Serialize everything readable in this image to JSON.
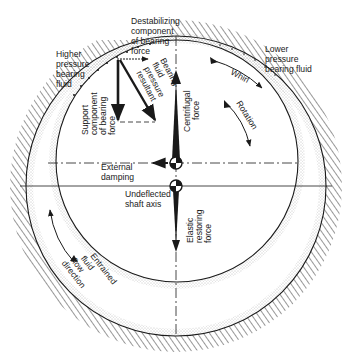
{
  "diagram": {
    "colors": {
      "ink": "#1a1a1a",
      "stipple": "#8a8a8a",
      "background": "#ffffff"
    },
    "labels": {
      "destabilizing": [
        "Destabilizing",
        "component",
        "of bearing",
        "force"
      ],
      "higher_pressure": [
        "Higher",
        "pressure",
        "bearing",
        "fluid"
      ],
      "lower_pressure": [
        "Lower",
        "pressure",
        "bearing fluid"
      ],
      "bearing_resultant": [
        "Bearing",
        "fluid",
        "pressure",
        "resultant"
      ],
      "support_component": [
        "Support",
        "component",
        "of bearing",
        "force"
      ],
      "whirl": "Whirl",
      "rotation": "Rotation",
      "centrifugal": [
        "Centrifugal",
        "force"
      ],
      "external_damping": [
        "External",
        "damping"
      ],
      "undeflected_axis": [
        "Undeflected",
        "shaft axis"
      ],
      "elastic_restoring": [
        "Elastic",
        "restoring",
        "force"
      ],
      "entrained_flow": [
        "Entrained",
        "fluid",
        "flow",
        "direction"
      ]
    },
    "icons": {
      "shaft_center": "shaft-center-symbol",
      "undeflected_center": "undeflected-axis-symbol"
    }
  }
}
